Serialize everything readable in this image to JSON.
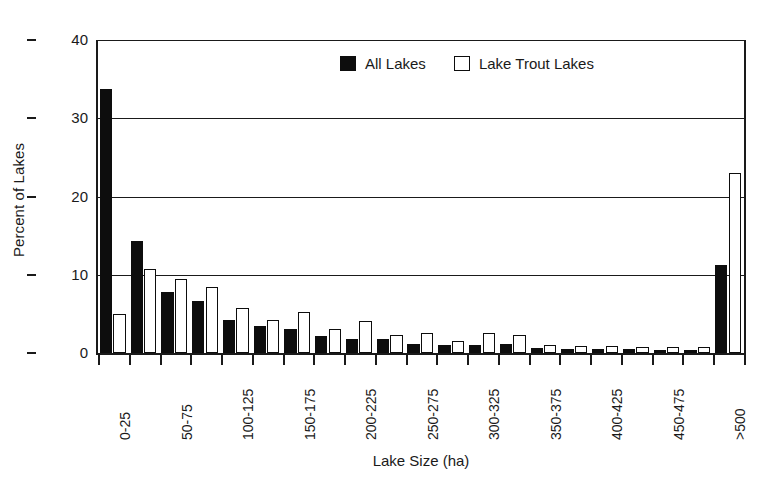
{
  "chart_data": {
    "type": "bar",
    "title": "",
    "xlabel": "Lake Size (ha)",
    "ylabel": "Percent of Lakes",
    "ylim": [
      0,
      40
    ],
    "yticks": [
      0,
      10,
      20,
      30,
      40
    ],
    "grid": true,
    "legend_position": "top-center",
    "categories": [
      "0-25",
      "25-50",
      "50-75",
      "75-100",
      "100-125",
      "125-150",
      "150-175",
      "175-200",
      "200-225",
      "225-250",
      "250-275",
      "275-300",
      "300-325",
      "325-350",
      "350-375",
      "375-400",
      "400-425",
      "425-450",
      "450-475",
      "475-500",
      ">500"
    ],
    "tick_labels_shown": [
      "0-25",
      "",
      "50-75",
      "",
      "100-125",
      "",
      "150-175",
      "",
      "200-225",
      "",
      "250-275",
      "",
      "300-325",
      "",
      "350-375",
      "",
      "400-425",
      "",
      "450-475",
      "",
      ">500"
    ],
    "series": [
      {
        "name": "All Lakes",
        "color": "#0d0d0d",
        "style": "filled",
        "values": [
          33.8,
          14.3,
          7.8,
          6.6,
          4.2,
          3.4,
          3.1,
          2.2,
          1.8,
          1.8,
          1.2,
          1.0,
          1.0,
          1.1,
          0.7,
          0.5,
          0.5,
          0.5,
          0.4,
          0.4,
          11.2
        ]
      },
      {
        "name": "Lake Trout Lakes",
        "color": "#ffffff",
        "style": "hollow",
        "values": [
          5.0,
          10.7,
          9.4,
          8.5,
          5.7,
          4.2,
          5.3,
          3.1,
          4.1,
          2.3,
          2.5,
          1.5,
          2.5,
          2.3,
          1.0,
          0.9,
          0.9,
          0.8,
          0.8,
          0.8,
          23.0
        ]
      }
    ]
  }
}
